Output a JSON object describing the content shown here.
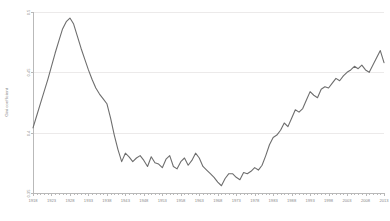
{
  "chart_data": {
    "type": "line",
    "title": "",
    "xlabel": "",
    "ylabel": "Gini coefficient",
    "xlim": [
      1918,
      2013
    ],
    "ylim": [
      0.35,
      0.5
    ],
    "grid": true,
    "legend": "none",
    "y_ticks": [
      "0.35",
      "0.4",
      "0.45",
      "0.5"
    ],
    "y_tick_values": [
      0.35,
      0.4,
      0.45,
      0.5
    ],
    "x_ticks": [
      "1918",
      "1923",
      "1928",
      "1933",
      "1938",
      "1943",
      "1948",
      "1953",
      "1958",
      "1963",
      "1968",
      "1973",
      "1978",
      "1983",
      "1988",
      "1993",
      "1998",
      "2003",
      "2008",
      "2013"
    ],
    "x_tick_values": [
      1918,
      1923,
      1928,
      1933,
      1938,
      1943,
      1948,
      1953,
      1958,
      1963,
      1968,
      1973,
      1978,
      1983,
      1988,
      1993,
      1998,
      2003,
      2008,
      2013
    ],
    "series": [
      {
        "name": "Gini coefficient",
        "color": "#6e6e6e",
        "x": [
          1918,
          1919,
          1920,
          1921,
          1922,
          1923,
          1924,
          1925,
          1926,
          1927,
          1928,
          1929,
          1930,
          1931,
          1932,
          1933,
          1934,
          1935,
          1936,
          1937,
          1938,
          1939,
          1940,
          1941,
          1942,
          1943,
          1944,
          1945,
          1946,
          1947,
          1948,
          1949,
          1950,
          1951,
          1952,
          1953,
          1954,
          1955,
          1956,
          1957,
          1958,
          1959,
          1960,
          1961,
          1962,
          1963,
          1964,
          1965,
          1966,
          1967,
          1968,
          1969,
          1970,
          1971,
          1972,
          1973,
          1974,
          1975,
          1976,
          1977,
          1978,
          1979,
          1980,
          1981,
          1982,
          1983,
          1984,
          1985,
          1986,
          1987,
          1988,
          1989,
          1990,
          1991,
          1992,
          1993,
          1994,
          1995,
          1996,
          1997,
          1998,
          1999,
          2000,
          2001,
          2002,
          2003,
          2004,
          2005,
          2006,
          2007,
          2008,
          2009,
          2010,
          2011,
          2012,
          2013
        ],
        "y": [
          0.404,
          0.414,
          0.424,
          0.434,
          0.444,
          0.455,
          0.466,
          0.476,
          0.486,
          0.492,
          0.495,
          0.49,
          0.48,
          0.47,
          0.461,
          0.452,
          0.444,
          0.437,
          0.432,
          0.428,
          0.424,
          0.412,
          0.398,
          0.386,
          0.376,
          0.383,
          0.38,
          0.376,
          0.379,
          0.381,
          0.377,
          0.372,
          0.38,
          0.375,
          0.374,
          0.371,
          0.378,
          0.381,
          0.372,
          0.37,
          0.376,
          0.379,
          0.373,
          0.377,
          0.383,
          0.379,
          0.372,
          0.369,
          0.366,
          0.363,
          0.359,
          0.356,
          0.362,
          0.366,
          0.366,
          0.363,
          0.361,
          0.367,
          0.366,
          0.368,
          0.371,
          0.369,
          0.373,
          0.381,
          0.39,
          0.396,
          0.398,
          0.402,
          0.408,
          0.405,
          0.412,
          0.419,
          0.417,
          0.42,
          0.427,
          0.434,
          0.431,
          0.429,
          0.436,
          0.438,
          0.437,
          0.441,
          0.445,
          0.443,
          0.447,
          0.45,
          0.452,
          0.455,
          0.453,
          0.456,
          0.452,
          0.45,
          0.456,
          0.462,
          0.468,
          0.458
        ]
      }
    ]
  }
}
